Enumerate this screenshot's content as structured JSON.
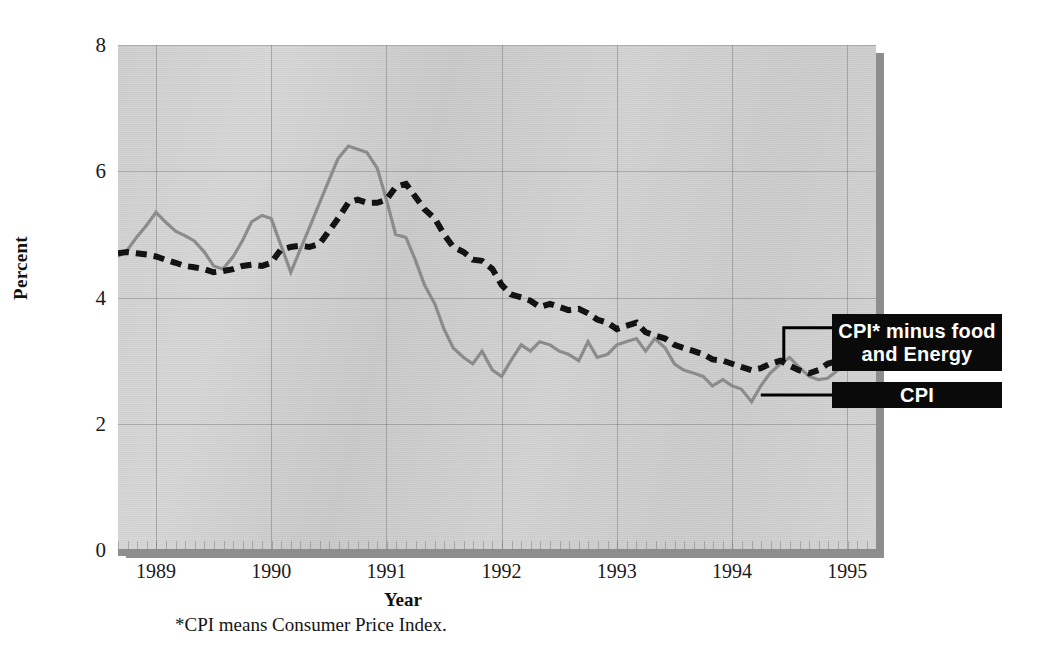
{
  "axes": {
    "ylabel": "Percent",
    "xlabel": "Year",
    "yticks": [
      "0",
      "2",
      "4",
      "6",
      "8"
    ],
    "xticks": [
      "1989",
      "1990",
      "1991",
      "1992",
      "1993",
      "1994",
      "1995"
    ]
  },
  "footnote": "*CPI means Consumer Price Index.",
  "legend": {
    "core_label": "CPI* minus food and Energy",
    "core_label_line1": "CPI* minus food",
    "core_label_line2": "and Energy",
    "cpi_label": "CPI"
  },
  "colors": {
    "cpi_line": "#8a8a8a",
    "core_line": "#0d0d0d",
    "plot_background": "#d0d0d0",
    "legend_background": "#0a0a0a",
    "legend_text": "#ffffff",
    "axis": "#8d8d8d"
  },
  "chart_data": {
    "type": "line",
    "title": "",
    "xlabel": "Year",
    "ylabel": "Percent",
    "ylim": [
      0,
      8
    ],
    "xlim": [
      1988.67,
      1995.25
    ],
    "grid": true,
    "legend_position": "right",
    "x": [
      1988.67,
      1988.75,
      1988.83,
      1988.92,
      1989.0,
      1989.08,
      1989.17,
      1989.25,
      1989.33,
      1989.42,
      1989.5,
      1989.58,
      1989.67,
      1989.75,
      1989.83,
      1989.92,
      1990.0,
      1990.08,
      1990.17,
      1990.25,
      1990.33,
      1990.42,
      1990.5,
      1990.58,
      1990.67,
      1990.75,
      1990.83,
      1990.92,
      1991.0,
      1991.08,
      1991.17,
      1991.25,
      1991.33,
      1991.42,
      1991.5,
      1991.58,
      1991.67,
      1991.75,
      1991.83,
      1991.92,
      1992.0,
      1992.08,
      1992.17,
      1992.25,
      1992.33,
      1992.42,
      1992.5,
      1992.58,
      1992.67,
      1992.75,
      1992.83,
      1992.92,
      1993.0,
      1993.08,
      1993.17,
      1993.25,
      1993.33,
      1993.42,
      1993.5,
      1993.58,
      1993.67,
      1993.75,
      1993.83,
      1993.92,
      1994.0,
      1994.08,
      1994.17,
      1994.25,
      1994.33,
      1994.42,
      1994.5,
      1994.58,
      1994.67,
      1994.75,
      1994.83,
      1994.92,
      1995.0,
      1995.08,
      1995.17
    ],
    "series": [
      {
        "name": "CPI",
        "style": "solid",
        "color": "#8a8a8a",
        "values": [
          4.65,
          4.75,
          4.95,
          5.15,
          5.35,
          5.2,
          5.05,
          4.98,
          4.9,
          4.72,
          4.5,
          4.45,
          4.65,
          4.9,
          5.2,
          5.3,
          5.25,
          4.85,
          4.4,
          4.75,
          5.1,
          5.5,
          5.85,
          6.2,
          6.4,
          6.35,
          6.3,
          6.05,
          5.55,
          5.0,
          4.95,
          4.6,
          4.2,
          3.9,
          3.5,
          3.2,
          3.05,
          2.95,
          3.15,
          2.85,
          2.75,
          3.0,
          3.25,
          3.15,
          3.3,
          3.25,
          3.15,
          3.1,
          3.0,
          3.3,
          3.05,
          3.1,
          3.25,
          3.3,
          3.35,
          3.15,
          3.35,
          3.2,
          2.95,
          2.85,
          2.8,
          2.75,
          2.6,
          2.7,
          2.6,
          2.55,
          2.35,
          2.6,
          2.8,
          2.95,
          3.05,
          2.9,
          2.75,
          2.7,
          2.72,
          2.85,
          2.95,
          3.1,
          3.05
        ]
      },
      {
        "name": "CPI* minus food and Energy",
        "style": "dashed",
        "color": "#0d0d0d",
        "values": [
          4.7,
          4.72,
          4.7,
          4.68,
          4.65,
          4.6,
          4.55,
          4.5,
          4.48,
          4.45,
          4.4,
          4.42,
          4.45,
          4.5,
          4.52,
          4.5,
          4.55,
          4.75,
          4.8,
          4.82,
          4.8,
          4.85,
          5.05,
          5.25,
          5.5,
          5.55,
          5.5,
          5.5,
          5.55,
          5.75,
          5.8,
          5.6,
          5.4,
          5.25,
          5.0,
          4.8,
          4.72,
          4.6,
          4.58,
          4.45,
          4.2,
          4.05,
          4.0,
          3.95,
          3.85,
          3.9,
          3.85,
          3.8,
          3.82,
          3.75,
          3.65,
          3.6,
          3.5,
          3.55,
          3.6,
          3.45,
          3.4,
          3.35,
          3.25,
          3.2,
          3.15,
          3.1,
          3.02,
          3.0,
          2.95,
          2.9,
          2.85,
          2.88,
          2.95,
          3.0,
          2.92,
          2.85,
          2.8,
          2.85,
          2.95,
          3.0,
          3.05,
          3.15,
          3.0
        ]
      }
    ]
  }
}
